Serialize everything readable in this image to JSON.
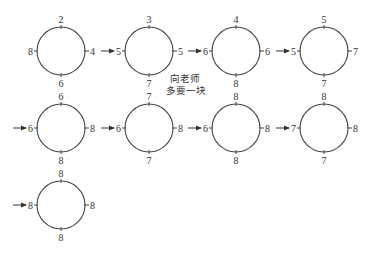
{
  "diagram": {
    "note": [
      "向老师",
      "多要一块"
    ],
    "stroke_color": "#444444",
    "text_color": "#333333",
    "circles": [
      {
        "id": 1,
        "row": 1,
        "cx": 61,
        "cy": 51,
        "top": "2",
        "right": "4",
        "bottom": "6",
        "left": "8",
        "incoming_arrow": false
      },
      {
        "id": 2,
        "row": 1,
        "cx": 149,
        "cy": 51,
        "top": "3",
        "right": "5",
        "bottom": "7",
        "left": "5",
        "incoming_arrow": true
      },
      {
        "id": 3,
        "row": 1,
        "cx": 236,
        "cy": 51,
        "top": "4",
        "right": "6",
        "bottom": "8",
        "left": "6",
        "incoming_arrow": true
      },
      {
        "id": 4,
        "row": 1,
        "cx": 324,
        "cy": 51,
        "top": "5",
        "right": "7",
        "bottom": "7",
        "left": "5",
        "incoming_arrow": true
      },
      {
        "id": 5,
        "row": 2,
        "cx": 61,
        "cy": 128,
        "top": "6",
        "right": "8",
        "bottom": "8",
        "left": "6",
        "incoming_arrow": true
      },
      {
        "id": 6,
        "row": 2,
        "cx": 149,
        "cy": 128,
        "top": "7",
        "right": "8",
        "bottom": "7",
        "left": "6",
        "incoming_arrow": true
      },
      {
        "id": 7,
        "row": 2,
        "cx": 236,
        "cy": 128,
        "top": "8",
        "right": "8",
        "bottom": "8",
        "left": "6",
        "incoming_arrow": true
      },
      {
        "id": 8,
        "row": 2,
        "cx": 324,
        "cy": 128,
        "top": "8",
        "right": "8",
        "bottom": "7",
        "left": "7",
        "incoming_arrow": true
      },
      {
        "id": 9,
        "row": 3,
        "cx": 61,
        "cy": 205,
        "top": "8",
        "right": "8",
        "bottom": "8",
        "left": "8",
        "incoming_arrow": true
      }
    ],
    "radius": 24
  }
}
